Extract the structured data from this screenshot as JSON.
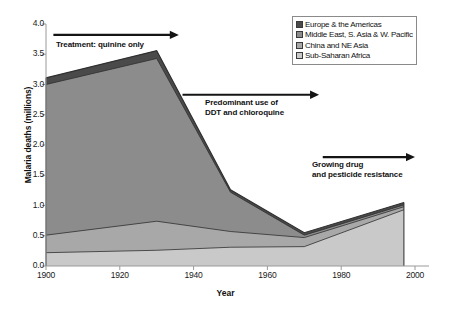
{
  "chart_data": {
    "type": "area",
    "stacked": true,
    "title": "",
    "xlabel": "Year",
    "ylabel": "Malaria deaths (millions)",
    "xlim": [
      1900,
      2000
    ],
    "ylim": [
      0.0,
      4.0
    ],
    "grid": false,
    "legend_position": "top-right",
    "x": [
      1900,
      1930,
      1950,
      1970,
      1997
    ],
    "xticks": [
      "1900",
      "1920",
      "1940",
      "1960",
      "1980",
      "2000"
    ],
    "xtick_values": [
      1900,
      1920,
      1940,
      1960,
      1980,
      2000
    ],
    "yticks": [
      "0.0",
      "0.5",
      "1.0",
      "1.5",
      "2.0",
      "2.5",
      "3.0",
      "3.5",
      "4.0"
    ],
    "ytick_values": [
      0.0,
      0.5,
      1.0,
      1.5,
      2.0,
      2.5,
      3.0,
      3.5,
      4.0
    ],
    "series": [
      {
        "name": "Sub-Saharan Africa",
        "color": "#c9c9c9",
        "values": [
          0.22,
          0.26,
          0.31,
          0.32,
          0.93
        ]
      },
      {
        "name": "China and NE Asia",
        "color": "#a8a8a8",
        "values": [
          0.29,
          0.48,
          0.26,
          0.15,
          0.05
        ]
      },
      {
        "name": "Middle East, S. Asia & W. Pacific",
        "color": "#8c8c8c",
        "values": [
          2.49,
          2.69,
          0.65,
          0.04,
          0.03
        ]
      },
      {
        "name": "Europe & the Americas",
        "color": "#4a4a4a",
        "values": [
          0.11,
          0.13,
          0.04,
          0.04,
          0.04
        ]
      }
    ],
    "totals": [
      3.11,
      3.56,
      1.26,
      0.55,
      1.05
    ],
    "annotations": [
      {
        "id": "treatment-quinine",
        "lines": [
          "Treatment: quinine only"
        ],
        "arrow_from_year": 1902,
        "arrow_to_year": 1936,
        "arrow_value": 3.82
      },
      {
        "id": "ddt-chloroquine",
        "lines": [
          "Predominant use of",
          "DDT and chloroquine"
        ],
        "arrow_from_year": 1937,
        "arrow_to_year": 1974,
        "arrow_value": 2.83
      },
      {
        "id": "drug-resistance",
        "lines": [
          "Growing drug",
          "and pesticide resistance"
        ],
        "arrow_from_year": 1975,
        "arrow_to_year": 2000,
        "arrow_value": 1.8
      }
    ]
  },
  "legend": {
    "items": [
      {
        "label": "Europe & the Americas",
        "color": "#4a4a4a"
      },
      {
        "label": "Middle East, S. Asia & W. Pacific",
        "color": "#8c8c8c"
      },
      {
        "label": "China and NE Asia",
        "color": "#a8a8a8"
      },
      {
        "label": "Sub-Saharan Africa",
        "color": "#c9c9c9"
      }
    ]
  },
  "axes": {
    "y_title": "Malaria deaths (millions)",
    "x_title": "Year",
    "axis_color": "#9a9a9a",
    "outline_color": "#3a3a3a"
  },
  "annotations": {
    "a1_line1": "Treatment: quinine only",
    "a2_line1": "Predominant use of",
    "a2_line2": "DDT and chloroquine",
    "a3_line1": "Growing drug",
    "a3_line2": "and pesticide resistance"
  }
}
